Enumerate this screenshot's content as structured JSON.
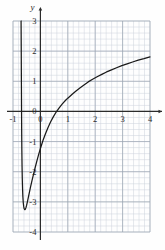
{
  "chart_data": {
    "type": "line",
    "title": "",
    "subtitle": "",
    "xlabel": "",
    "ylabel": "y",
    "xlim": [
      -1,
      4
    ],
    "ylim": [
      -4,
      3
    ],
    "grid": true,
    "minor_grid": true,
    "minor_grid_divisions": 5,
    "legend": "none",
    "x_ticks": [
      -1,
      0,
      1,
      2,
      3,
      4
    ],
    "y_ticks": [
      3,
      2,
      1,
      0,
      -1,
      -2,
      -3,
      -4
    ],
    "x_tick_labels": [
      "-1",
      "0",
      "1",
      "2",
      "3",
      "4"
    ],
    "y_tick_labels": [
      "3",
      "2",
      "1",
      "0",
      "-1",
      "-2",
      "-3",
      "-4"
    ],
    "annotations": [],
    "series": [
      {
        "name": "curve",
        "color": "#1a1a1a",
        "x_intercept": 1,
        "minimum": [
          -0.55,
          -3.25
        ],
        "vertical_asymptote": -0.72,
        "points": [
          [
            -0.705,
            3.0
          ],
          [
            -0.7,
            2.2
          ],
          [
            -0.696,
            1.4
          ],
          [
            -0.692,
            0.7
          ],
          [
            -0.688,
            0.0
          ],
          [
            -0.683,
            -0.7
          ],
          [
            -0.677,
            -1.3
          ],
          [
            -0.67,
            -1.8
          ],
          [
            -0.662,
            -2.2
          ],
          [
            -0.652,
            -2.55
          ],
          [
            -0.64,
            -2.82
          ],
          [
            -0.626,
            -3.02
          ],
          [
            -0.61,
            -3.15
          ],
          [
            -0.592,
            -3.23
          ],
          [
            -0.572,
            -3.26
          ],
          [
            -0.552,
            -3.25
          ],
          [
            -0.53,
            -3.2
          ],
          [
            -0.505,
            -3.12
          ],
          [
            -0.475,
            -3.0
          ],
          [
            -0.44,
            -2.85
          ],
          [
            -0.4,
            -2.68
          ],
          [
            -0.355,
            -2.49
          ],
          [
            -0.305,
            -2.29
          ],
          [
            -0.25,
            -2.08
          ],
          [
            -0.19,
            -1.86
          ],
          [
            -0.125,
            -1.63
          ],
          [
            -0.055,
            -1.4
          ],
          [
            0.02,
            -1.17
          ],
          [
            0.1,
            -0.95
          ],
          [
            0.185,
            -0.74
          ],
          [
            0.275,
            -0.54
          ],
          [
            0.37,
            -0.35
          ],
          [
            0.47,
            -0.18
          ],
          [
            0.575,
            -0.02
          ],
          [
            0.685,
            0.12
          ],
          [
            0.8,
            0.25
          ],
          [
            0.92,
            0.37
          ],
          [
            1.0,
            0.44
          ],
          [
            1.17,
            0.58
          ],
          [
            1.3,
            0.68
          ],
          [
            1.44,
            0.78
          ],
          [
            1.59,
            0.88
          ],
          [
            1.745,
            0.98
          ],
          [
            1.905,
            1.07
          ],
          [
            2.07,
            1.15
          ],
          [
            2.24,
            1.23
          ],
          [
            2.415,
            1.31
          ],
          [
            2.595,
            1.38
          ],
          [
            2.78,
            1.45
          ],
          [
            2.97,
            1.52
          ],
          [
            3.165,
            1.58
          ],
          [
            3.365,
            1.64
          ],
          [
            3.57,
            1.7
          ],
          [
            3.78,
            1.75
          ],
          [
            4.0,
            1.81
          ]
        ]
      }
    ]
  },
  "colors": {
    "curve": "#1a1a1a",
    "axis": "#2b2b2b",
    "major_grid": "#9aa3b0",
    "minor_grid": "#ccd3dd",
    "background": "#fefefe",
    "label": "#2b2b2b"
  },
  "axes": {
    "y_axis_label": "y",
    "x_axis_label": ""
  }
}
